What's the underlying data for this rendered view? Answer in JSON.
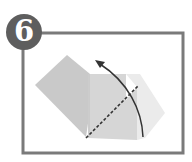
{
  "step": {
    "number": "6"
  },
  "diagram": {
    "frame_color": "#7a7a7a",
    "paper_dark": "#c9c9c9",
    "paper_mid": "#d9d9d9",
    "paper_light": "#ececec",
    "line_color": "#333333",
    "fold_line_style": "dashed",
    "arrow_direction": "counterclockwise-up"
  }
}
